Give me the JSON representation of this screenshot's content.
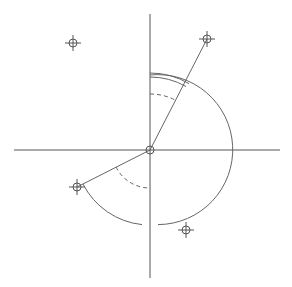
{
  "diagram": {
    "title": "",
    "colors": {
      "background": "#ffffff",
      "axis": "#555555",
      "line": "#666666",
      "arc": "#666666",
      "marker": "#555555"
    },
    "origin": {
      "x": 150,
      "y": 150,
      "radius": 4
    },
    "axes": {
      "horizontal": {
        "x1": 14,
        "y1": 150,
        "x2": 280,
        "y2": 150
      },
      "vertical": {
        "x1": 150,
        "y1": 14,
        "x2": 150,
        "y2": 278
      }
    },
    "markers": [
      {
        "id": "point-a",
        "x": 73,
        "y": 43
      },
      {
        "id": "point-b",
        "x": 207,
        "y": 39
      },
      {
        "id": "point-c",
        "x": 77,
        "y": 187
      },
      {
        "id": "point-d",
        "x": 186,
        "y": 230
      }
    ],
    "segments": [
      {
        "id": "ray-to-b",
        "x1": 150,
        "y1": 150,
        "x2": 207,
        "y2": 39
      },
      {
        "id": "ray-to-c",
        "x1": 150,
        "y1": 150,
        "x2": 77,
        "y2": 187
      }
    ],
    "arcs": [
      {
        "id": "main-arc-right",
        "d": "M 150 75 A 75 75 0 1 1 158 224.6",
        "dashed": false
      },
      {
        "id": "angle-arc-outer",
        "d": "M 150 73 A 77 77 0 0 1 189 83.6",
        "dashed": false
      },
      {
        "id": "angle-arc-inner",
        "d": "M 150 77 A 73 73 0 0 1 186 86.5",
        "dashed": false
      },
      {
        "id": "angle-arc-dashed-top",
        "d": "M 150 94 A 56 56 0 0 1 176 100.4",
        "dashed": true
      },
      {
        "id": "main-arc-lower-left",
        "d": "M 83 184 A 75 75 0 0 0 142 224.6",
        "dashed": false
      },
      {
        "id": "angle-arc-dashed-lower",
        "d": "M 116 167 A 38 38 0 0 0 150 188",
        "dashed": true
      }
    ]
  }
}
